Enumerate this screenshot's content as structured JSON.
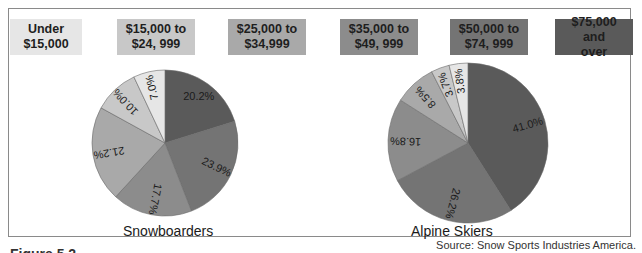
{
  "legend": [
    {
      "label": "Under\n$15,000",
      "line1": "Under",
      "line2": "$15,000",
      "color": "#e6e6e6"
    },
    {
      "label": "$15,000 to $24, 999",
      "line1": "$15,000 to",
      "line2": "$24, 999",
      "color": "#c8c8c8"
    },
    {
      "label": "$25,000 to $34,999",
      "line1": "$25,000 to",
      "line2": "$34,999",
      "color": "#a9a9a9"
    },
    {
      "label": "$35,000 to $49, 999",
      "line1": "$35,000 to",
      "line2": "$49, 999",
      "color": "#8c8c8c"
    },
    {
      "label": "$50,000 to $74, 999",
      "line1": "$50,000 to",
      "line2": "$74, 999",
      "color": "#747474"
    },
    {
      "label": "$75,000 and over",
      "line1": "$75,000 and",
      "line2": "over",
      "color": "#5a5a5a"
    }
  ],
  "source": "Source: Snow Sports Industries America.",
  "figure_label": "Figure 5.2",
  "chart_data": [
    {
      "type": "pie",
      "title": "Snowboarders",
      "categories": [
        "$75,000 and over",
        "$50,000 to $74,999",
        "$35,000 to $49,999",
        "$25,000 to $34,999",
        "$15,000 to $24,999",
        "Under $15,000"
      ],
      "values": [
        20.2,
        23.9,
        17.7,
        21.2,
        10.0,
        7.0
      ],
      "labels": [
        "20.2%",
        "23.9%",
        "17.7%",
        "21.2%",
        "10.0%",
        "7.0%"
      ],
      "start_angle": "12 o'clock",
      "direction": "clockwise"
    },
    {
      "type": "pie",
      "title": "Alpine Skiers",
      "categories": [
        "$75,000 and over",
        "$50,000 to $74,999",
        "$35,000 to $49,999",
        "$25,000 to $34,999",
        "$15,000 to $24,999",
        "Under $15,000"
      ],
      "values": [
        41.0,
        26.2,
        16.8,
        8.5,
        3.7,
        3.8
      ],
      "labels": [
        "41.0%",
        "26.2%",
        "16.8%",
        "8.5%",
        "3.7%",
        "3.8%"
      ],
      "start_angle": "12 o'clock",
      "direction": "clockwise"
    }
  ]
}
